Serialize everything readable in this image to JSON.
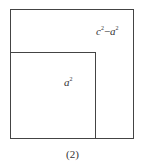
{
  "figure": {
    "outer_square_label": {
      "base1": "c",
      "exp1": "2",
      "op": "−",
      "base2": "a",
      "exp2": "2"
    },
    "inner_square_label": {
      "base": "a",
      "exp": "2"
    },
    "caption": "(2)"
  }
}
